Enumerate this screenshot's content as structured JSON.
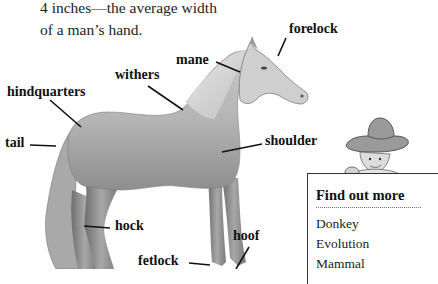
{
  "intro_text": {
    "line1": "4 inches—the average width",
    "line2": "of a man’s hand."
  },
  "diagram": {
    "labels": [
      {
        "id": "forelock",
        "text": "forelock"
      },
      {
        "id": "mane",
        "text": "mane"
      },
      {
        "id": "withers",
        "text": "withers"
      },
      {
        "id": "hindquarters",
        "text": "hindquarters"
      },
      {
        "id": "tail",
        "text": "tail"
      },
      {
        "id": "shoulder",
        "text": "shoulder"
      },
      {
        "id": "hock",
        "text": "hock"
      },
      {
        "id": "hoof",
        "text": "hoof"
      },
      {
        "id": "fetlock",
        "text": "fetlock"
      }
    ]
  },
  "find_out_more": {
    "title": "Find out more",
    "items": [
      "Donkey",
      "Evolution",
      "Mammal"
    ]
  }
}
